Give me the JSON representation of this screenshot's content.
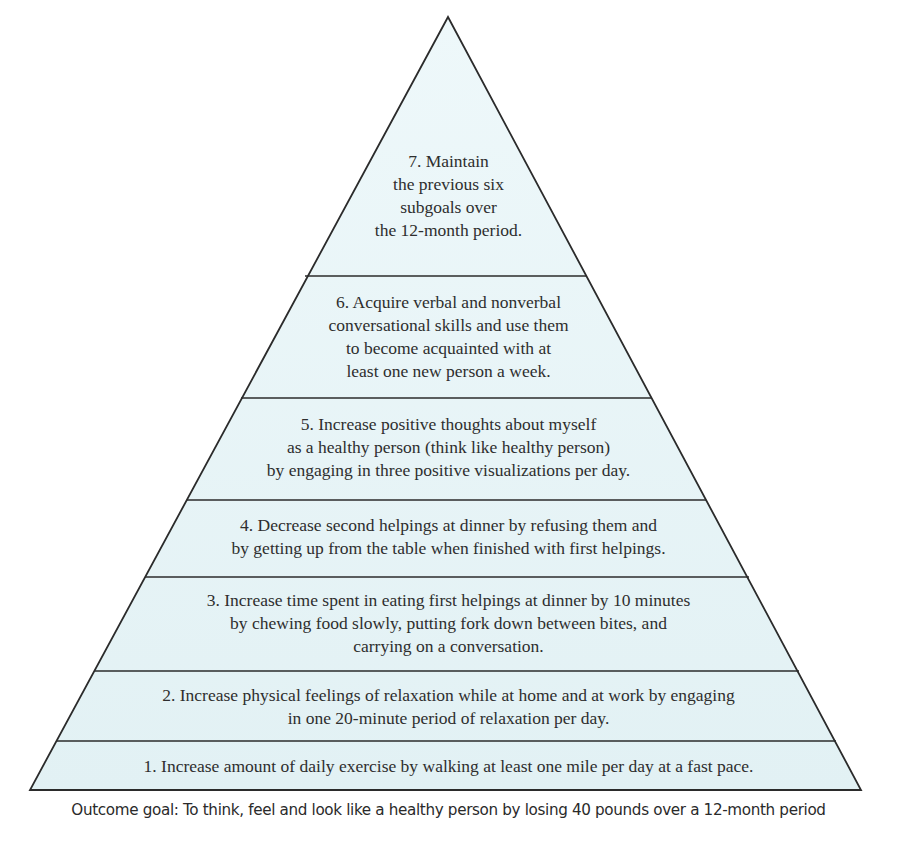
{
  "diagram": {
    "type": "goal-pyramid",
    "colors": {
      "fill": "#e6f4f7",
      "fill_top": "#ecf7f9",
      "outline": "#2b2b2b",
      "text": "#2e2e2e"
    },
    "levels": [
      {
        "number": 7,
        "lines": [
          "7. Maintain",
          "the previous six",
          "subgoals over",
          "the 12-month period."
        ]
      },
      {
        "number": 6,
        "lines": [
          "6. Acquire verbal and nonverbal",
          "conversational skills and use them",
          "to become acquainted with at",
          "least one new person a week."
        ]
      },
      {
        "number": 5,
        "lines": [
          "5. Increase positive thoughts about myself",
          "as a healthy person (think like healthy person)",
          "by engaging in three positive visualizations per day."
        ]
      },
      {
        "number": 4,
        "lines": [
          "4. Decrease second helpings at dinner by refusing them and",
          "by getting up from the table when finished with first helpings."
        ]
      },
      {
        "number": 3,
        "lines": [
          "3. Increase time spent in eating first helpings at dinner by 10 minutes",
          "by chewing food slowly, putting fork down between bites, and",
          "carrying on a conversation."
        ]
      },
      {
        "number": 2,
        "lines": [
          "2. Increase physical feelings of relaxation while at home and at work by engaging",
          "in one 20-minute period of relaxation per day."
        ]
      },
      {
        "number": 1,
        "lines": [
          "1. Increase amount of daily exercise by walking at least one mile per day at a fast pace."
        ]
      }
    ],
    "caption": "Outcome goal: To think, feel and look like a healthy person by losing 40 pounds over a 12-month period"
  }
}
